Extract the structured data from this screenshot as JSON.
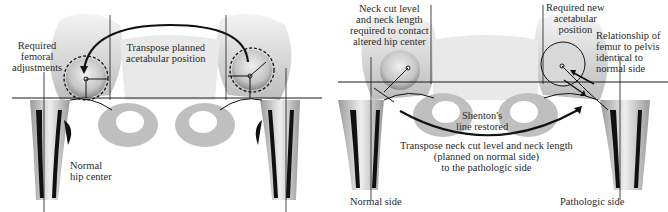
{
  "left_panel": {
    "labels": {
      "required_femoral_adjustments": "Required\nfemoral\nadjustments",
      "transpose_planned_acetabular": "Transpose planned\nacetabular position",
      "normal_hip_center": "Normal\nhip center"
    }
  },
  "right_panel": {
    "labels": {
      "neck_cut_level": "Neck cut level\nand neck length\nrequired to contact\naltered hip center",
      "required_new_acetabular": "Required new\nacetabular\nposition",
      "relationship_femur_pelvis": "Relationship of\nfemur to pelvis\nidentical to\nnormal side",
      "shentons_line": "Shenton's\nline restored",
      "transpose_neck_cut": "Transpose neck cut level and neck length\n(planned on normal side)\nto the pathologic side",
      "normal_side": "Normal side",
      "pathologic_side": "Pathologic side"
    }
  },
  "colors": {
    "bone_light": "#e6e6e6",
    "bone_mid": "#b8b8b8",
    "bone_dark": "#7a7a7a",
    "cortex": "#111111",
    "line": "#1a1a1a"
  }
}
